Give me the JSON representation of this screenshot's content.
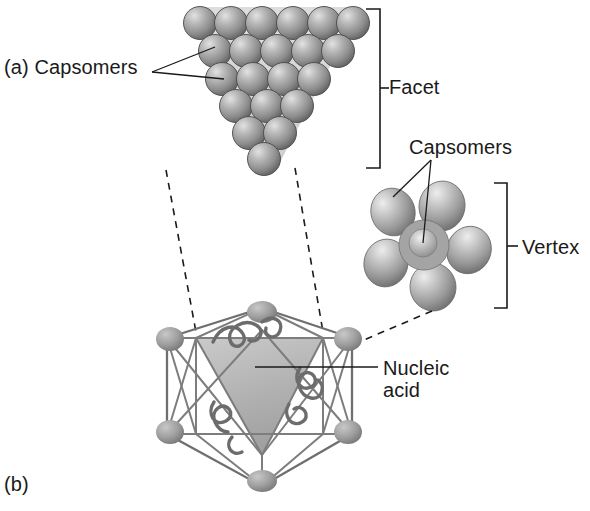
{
  "figure": {
    "panels": [
      {
        "id": "a",
        "label": "(a)",
        "caption": "Facet composed of capsomers"
      },
      {
        "id": "b",
        "label": "(b)",
        "caption": "Complete icosahedral capsid with nucleic acid"
      }
    ],
    "background_color": "#ffffff",
    "ink_color": "#1a1a1a"
  },
  "labels": {
    "panel_a": "(a) Capsomers",
    "panel_b": "(b)",
    "facet": "Facet",
    "capsomers_vertex": "Capsomers",
    "vertex": "Vertex",
    "nucleic_acid_line1": "Nucleic",
    "nucleic_acid_line2": "acid"
  },
  "diagram_data": {
    "type": "scientific-illustration",
    "subject": "icosahedral virus capsid",
    "facet": {
      "shape": "inverted-triangle",
      "rows_of_capsomers": [
        6,
        5,
        4,
        3,
        2,
        1
      ],
      "total_capsomers": 21,
      "triangle_fill": "#d9d9d9",
      "capsomer_color": "#8a8a8a",
      "capsomer_highlight": "#d6d6d6"
    },
    "vertex": {
      "shape": "pentamer",
      "outer_capsomers": 5,
      "central_capsomers": 1,
      "total_capsomers": 6,
      "capsomer_color": "#9a9a9a"
    },
    "capsid": {
      "shape": "icosahedron",
      "faces": 20,
      "vertices": 12,
      "edges": 30,
      "highlighted_facet_fill": "#b5b5b5",
      "wireframe_color": "#7d7d7d",
      "vertex_node_color": "#9d9d9d",
      "contents": "nucleic acid strand"
    },
    "connectors": [
      {
        "from": "facet",
        "to": "capsid-front-facet",
        "style": "dashed"
      },
      {
        "from": "vertex",
        "to": "capsid-right-vertex",
        "style": "dashed"
      }
    ],
    "brackets": [
      {
        "label": "Facet",
        "spans": "facet illustration"
      },
      {
        "label": "Vertex",
        "spans": "vertex pentamer illustration"
      }
    ]
  }
}
